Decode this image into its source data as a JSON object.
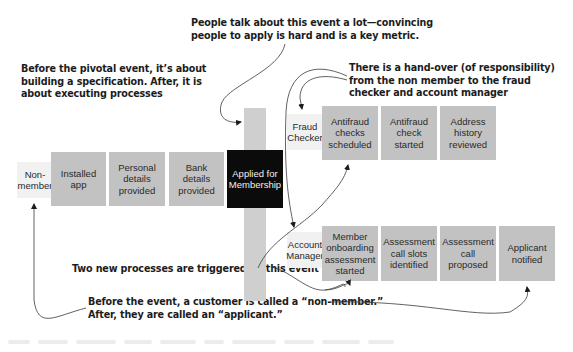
{
  "annotations": {
    "pivotal": "Before the pivotal event, it’s about\nbuilding a specification. After, it is\nabout executing processes",
    "people_talk": "People talk about this event a lot—convincing\npeople to apply is hard and is a key metric.",
    "handover": "There is a hand-over (of responsibility)\nfrom the non member to the fraud\nchecker and account manager",
    "two_processes": "Two new processes are triggered by this event",
    "naming": "Before the event, a customer is called a “non-member.”\nAfter, they are called an “applicant.”"
  },
  "actors": {
    "non_member": "Non-\nmember",
    "fraud_checker": "Fraud\nChecker",
    "account_manager": "Account\nManager"
  },
  "pre_event_timeline": [
    {
      "label": "Installed\napp"
    },
    {
      "label": "Personal\ndetails\nprovided"
    },
    {
      "label": "Bank\ndetails\nprovided"
    }
  ],
  "pivotal_event": {
    "label": "Applied for\nMembership",
    "color": "#0b0b0b"
  },
  "fraud_process": [
    {
      "label": "Antifraud\nchecks\nscheduled"
    },
    {
      "label": "Antifraud\ncheck\nstarted"
    },
    {
      "label": "Address\nhistory\nreviewed"
    }
  ],
  "account_process": [
    {
      "label": "Member\nonboarding\nassessment\nstarted"
    },
    {
      "label": "Assessment\ncall slots\nidentified"
    },
    {
      "label": "Assessment\ncall\nproposed"
    },
    {
      "label": "Applicant\nnotified"
    }
  ],
  "colors": {
    "event_box": "#c2c2c2",
    "pivot_box": "#0b0b0b",
    "actor_box": "#f1f1f1",
    "pivot_bar": "#cfcfcf",
    "text": "#1c1c1c"
  }
}
